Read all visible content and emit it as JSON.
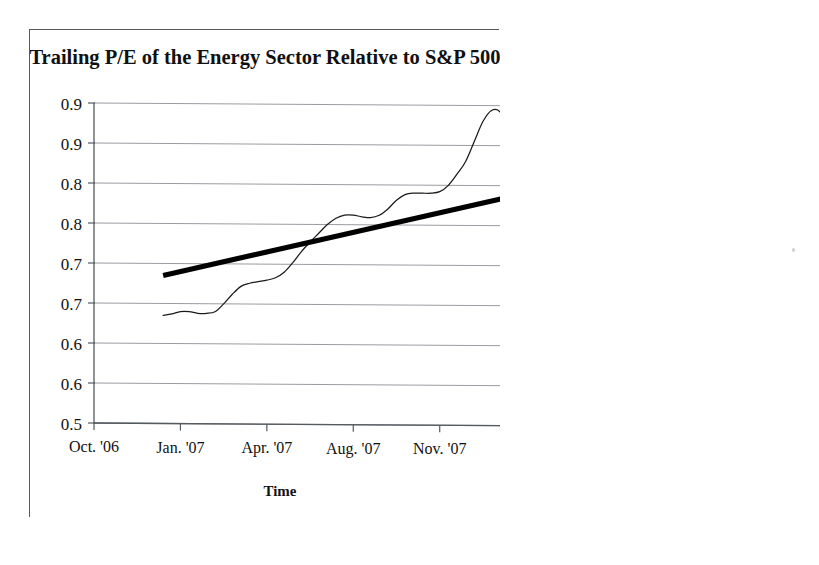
{
  "figure": {
    "background_color": "#ffffff",
    "frame_color": "#555a5e",
    "ink_color": "#1a1a1a",
    "gridline_color": "#8c9095"
  },
  "chart_data": {
    "type": "line",
    "title": "Trailing P/E of the Energy Sector Relative to S&P 500",
    "xlabel": "Time",
    "ylabel": "",
    "grid": true,
    "legend_position": "none",
    "ylim": [
      0.55,
      0.95
    ],
    "ytick_values": [
      0.95,
      0.9,
      0.85,
      0.8,
      0.75,
      0.7,
      0.65,
      0.6,
      0.55
    ],
    "ytick_labels": [
      "0.9",
      "0.9",
      "0.8",
      "0.8",
      "0.7",
      "0.7",
      "0.6",
      "0.6",
      "0.5"
    ],
    "categories": [
      "Oct. '06",
      "Jan. '07",
      "Apr. '07",
      "Aug. '07",
      "Nov. '07",
      "Feb. '08",
      "Jun. '08",
      "Sep. '08"
    ],
    "xtick_labels": [
      "Oct. '06",
      "Jan. '07",
      "Apr. '07",
      "Aug. '07",
      "Nov. '07",
      "Feb. '08",
      "Jun. '08",
      "Sep. '08"
    ],
    "series": [
      {
        "name": "Trailing P/E relative to S&P 500",
        "style": "thin-line",
        "color": "#1a1a1a",
        "x": [
          0.8,
          0.9,
          1.0,
          1.1,
          1.2,
          1.3,
          1.4,
          1.5,
          1.6,
          1.7,
          1.8,
          1.9,
          2.0,
          2.1,
          2.2,
          2.3,
          2.4,
          2.5,
          2.6,
          2.7,
          2.8,
          2.9,
          3.0,
          3.1,
          3.2,
          3.3,
          3.4,
          3.5,
          3.6,
          3.7,
          3.8,
          3.9,
          4.0,
          4.1,
          4.2,
          4.3,
          4.4,
          4.5,
          4.6,
          4.7,
          4.8,
          4.9,
          5.0,
          5.1,
          5.2,
          5.3,
          5.4,
          5.5,
          5.6,
          5.7,
          5.8,
          5.9,
          6.0,
          6.1,
          6.2,
          6.3,
          6.4,
          6.5,
          6.6,
          6.7,
          6.8,
          6.9
        ],
        "values": [
          0.685,
          0.687,
          0.69,
          0.69,
          0.688,
          0.688,
          0.69,
          0.7,
          0.712,
          0.722,
          0.726,
          0.728,
          0.73,
          0.733,
          0.74,
          0.752,
          0.766,
          0.778,
          0.789,
          0.8,
          0.808,
          0.812,
          0.812,
          0.81,
          0.809,
          0.812,
          0.82,
          0.831,
          0.838,
          0.84,
          0.84,
          0.84,
          0.842,
          0.85,
          0.864,
          0.88,
          0.905,
          0.93,
          0.944,
          0.942,
          0.92,
          0.88,
          0.835,
          0.795,
          0.77,
          0.765,
          0.775,
          0.8,
          0.822,
          0.831,
          0.83,
          0.82,
          0.808,
          0.8,
          0.799,
          0.805,
          0.825,
          0.862,
          0.898,
          0.915,
          0.9,
          0.79
        ]
      },
      {
        "name": "Linear trend",
        "style": "thick-line",
        "color": "#000000",
        "x": [
          0.8,
          6.55
        ],
        "values": [
          0.735,
          0.88
        ]
      }
    ],
    "annotations": []
  }
}
